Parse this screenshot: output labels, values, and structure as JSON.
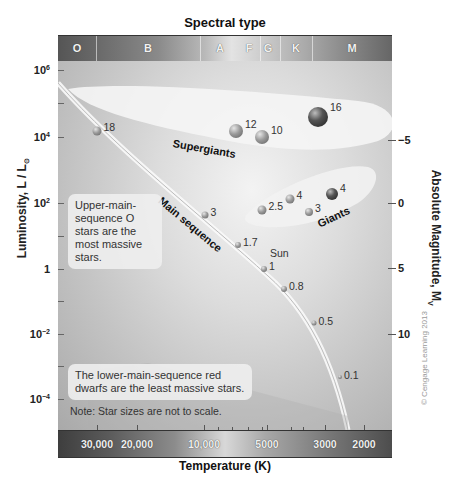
{
  "title": "Spectral type",
  "xlabel": "Temperature (K)",
  "ylabel_left": {
    "text": "Luminosity, L / L",
    "subscript": "⊙"
  },
  "ylabel_right": {
    "text": "Absolute Magnitude, M",
    "subscript": "V"
  },
  "spectral_types": [
    {
      "label": "O",
      "x": 77
    },
    {
      "label": "B",
      "x": 148
    },
    {
      "label": "A",
      "x": 220
    },
    {
      "label": "F",
      "x": 249
    },
    {
      "label": "G",
      "x": 268
    },
    {
      "label": "K",
      "x": 296
    },
    {
      "label": "M",
      "x": 352
    }
  ],
  "spectral_dividers": [
    96,
    200,
    260,
    280,
    312
  ],
  "luminosity_ticks": [
    {
      "base": "10",
      "exp": "6",
      "y": 70
    },
    {
      "base": "10",
      "exp": "4",
      "y": 137
    },
    {
      "base": "10",
      "exp": "2",
      "y": 203
    },
    {
      "base": "1",
      "exp": "",
      "y": 269
    },
    {
      "base": "10",
      "exp": "−2",
      "y": 334
    },
    {
      "base": "10",
      "exp": "−4",
      "y": 399
    }
  ],
  "magnitude_ticks": [
    {
      "label": "−5",
      "y": 140
    },
    {
      "label": "0",
      "y": 203
    },
    {
      "label": "5",
      "y": 268
    },
    {
      "label": "10",
      "y": 334
    }
  ],
  "temperature_ticks": [
    {
      "label": "30,000",
      "x": 97
    },
    {
      "label": "20,000",
      "x": 137
    },
    {
      "label": "10,000",
      "x": 204
    },
    {
      "label": "5000",
      "x": 267
    },
    {
      "label": "3000",
      "x": 325
    },
    {
      "label": "2000",
      "x": 364
    }
  ],
  "regions": {
    "supergiants": "Supergiants",
    "main_sequence": "Main sequence",
    "giants": "Giants"
  },
  "stars": {
    "main_sequence": [
      {
        "mass": "18",
        "x": 97,
        "y": 131
      },
      {
        "mass": "3",
        "x": 205,
        "y": 215
      },
      {
        "mass": "1.7",
        "x": 238,
        "y": 245
      },
      {
        "mass": "1",
        "x": 264,
        "y": 269,
        "name": "Sun"
      },
      {
        "mass": "0.8",
        "x": 284,
        "y": 289
      },
      {
        "mass": "0.5",
        "x": 314,
        "y": 323
      },
      {
        "mass": "0.1",
        "x": 340,
        "y": 377
      }
    ],
    "supergiants": [
      {
        "mass": "12",
        "x": 236,
        "y": 131
      },
      {
        "mass": "10",
        "x": 262,
        "y": 137
      },
      {
        "mass": "16",
        "x": 318,
        "y": 117
      }
    ],
    "giants": [
      {
        "mass": "2.5",
        "x": 262,
        "y": 210
      },
      {
        "mass": "4",
        "x": 290,
        "y": 199
      },
      {
        "mass": "3",
        "x": 309,
        "y": 212
      },
      {
        "mass": "4",
        "x": 332,
        "y": 194
      }
    ]
  },
  "notes": {
    "upper_main": "Upper-main-sequence O stars are the most massive stars.",
    "lower_main": "The lower-main-sequence red dwarfs are the least massive stars.",
    "scale_note": "Note: Star sizes are not to scale."
  },
  "copyright": "© Cengage Learning 2013",
  "colors": {
    "background": "#ffffff",
    "plot_light": "#f3f3f3",
    "plot_dark": "#a9a9a9",
    "bar_dark": "#444444",
    "text": "#222222"
  }
}
